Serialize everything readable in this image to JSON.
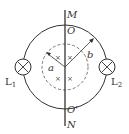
{
  "diagram": {
    "labels": {
      "M": "M",
      "O": "O",
      "O_prime": "O'",
      "N": "N",
      "a": "a",
      "b": "b",
      "L1_main": "L",
      "L1_sub": "1",
      "L2_main": "L",
      "L2_sub": "2"
    },
    "field_marker": "×",
    "colors": {
      "line": "#333333",
      "dashed": "#555555"
    }
  }
}
